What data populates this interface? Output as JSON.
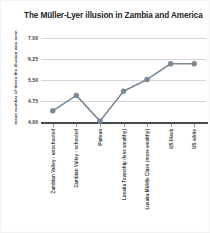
{
  "chart_data": {
    "type": "line",
    "title": "The Müller-Lyer illusion in Zambia and America",
    "xlabel": "",
    "ylabel": "mean number of times the illusion was seen",
    "categories": [
      "Zambian Valley - unschooled",
      "Zambian Valley - schooled",
      "Plateau",
      "Lusaka Township (less wealthy)",
      "Lusaka Middle Class (more wealthy)",
      "US black",
      "US white"
    ],
    "values": [
      4.4,
      4.95,
      4.03,
      5.1,
      5.52,
      6.08,
      6.08
    ],
    "yticks": [
      "4.00",
      "4.75",
      "5.50",
      "6.25",
      "7.00"
    ],
    "ytick_values": [
      4.0,
      4.75,
      5.5,
      6.25,
      7.0
    ],
    "ylim": [
      4.0,
      7.0
    ],
    "grid": true,
    "legend": "none",
    "series_color": "#7b8b9a",
    "marker_color": "#7b8b9a",
    "grid_color": "#d5d5d5",
    "axis_color": "#4a4a4a",
    "text_color": "#3c3c3c",
    "background": "#ffffff"
  }
}
